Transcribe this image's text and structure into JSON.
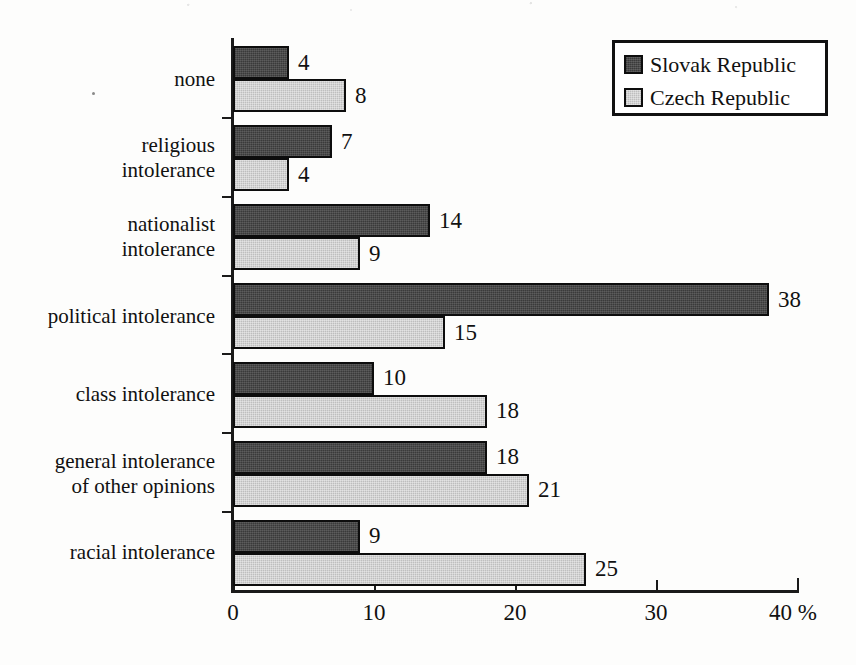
{
  "chart_data": {
    "type": "bar",
    "orientation": "horizontal",
    "title": "",
    "xlabel": "%",
    "ylabel": "",
    "xlim": [
      0,
      40
    ],
    "xticks": [
      0,
      10,
      20,
      30,
      40
    ],
    "xtick_labels": [
      "0",
      "10",
      "20",
      "30",
      "40"
    ],
    "axis_unit_suffix": "%",
    "grid": false,
    "legend_position": "top-right",
    "categories": [
      "none",
      "religious\nintolerance",
      "nationalist\nintolerance",
      "political intolerance",
      "class intolerance",
      "general intolerance\nof other opinions",
      "racial intolerance"
    ],
    "series": [
      {
        "name": "Slovak Republic",
        "color": "#4a4a4a",
        "values": [
          4,
          7,
          14,
          38,
          10,
          18,
          9
        ]
      },
      {
        "name": "Czech Republic",
        "color": "#d3d3d3",
        "values": [
          8,
          4,
          9,
          15,
          18,
          21,
          25
        ]
      }
    ]
  },
  "legend": {
    "entries": [
      {
        "label": "Slovak Republic",
        "swatch": "slovak"
      },
      {
        "label": "Czech Republic",
        "swatch": "czech"
      }
    ]
  }
}
